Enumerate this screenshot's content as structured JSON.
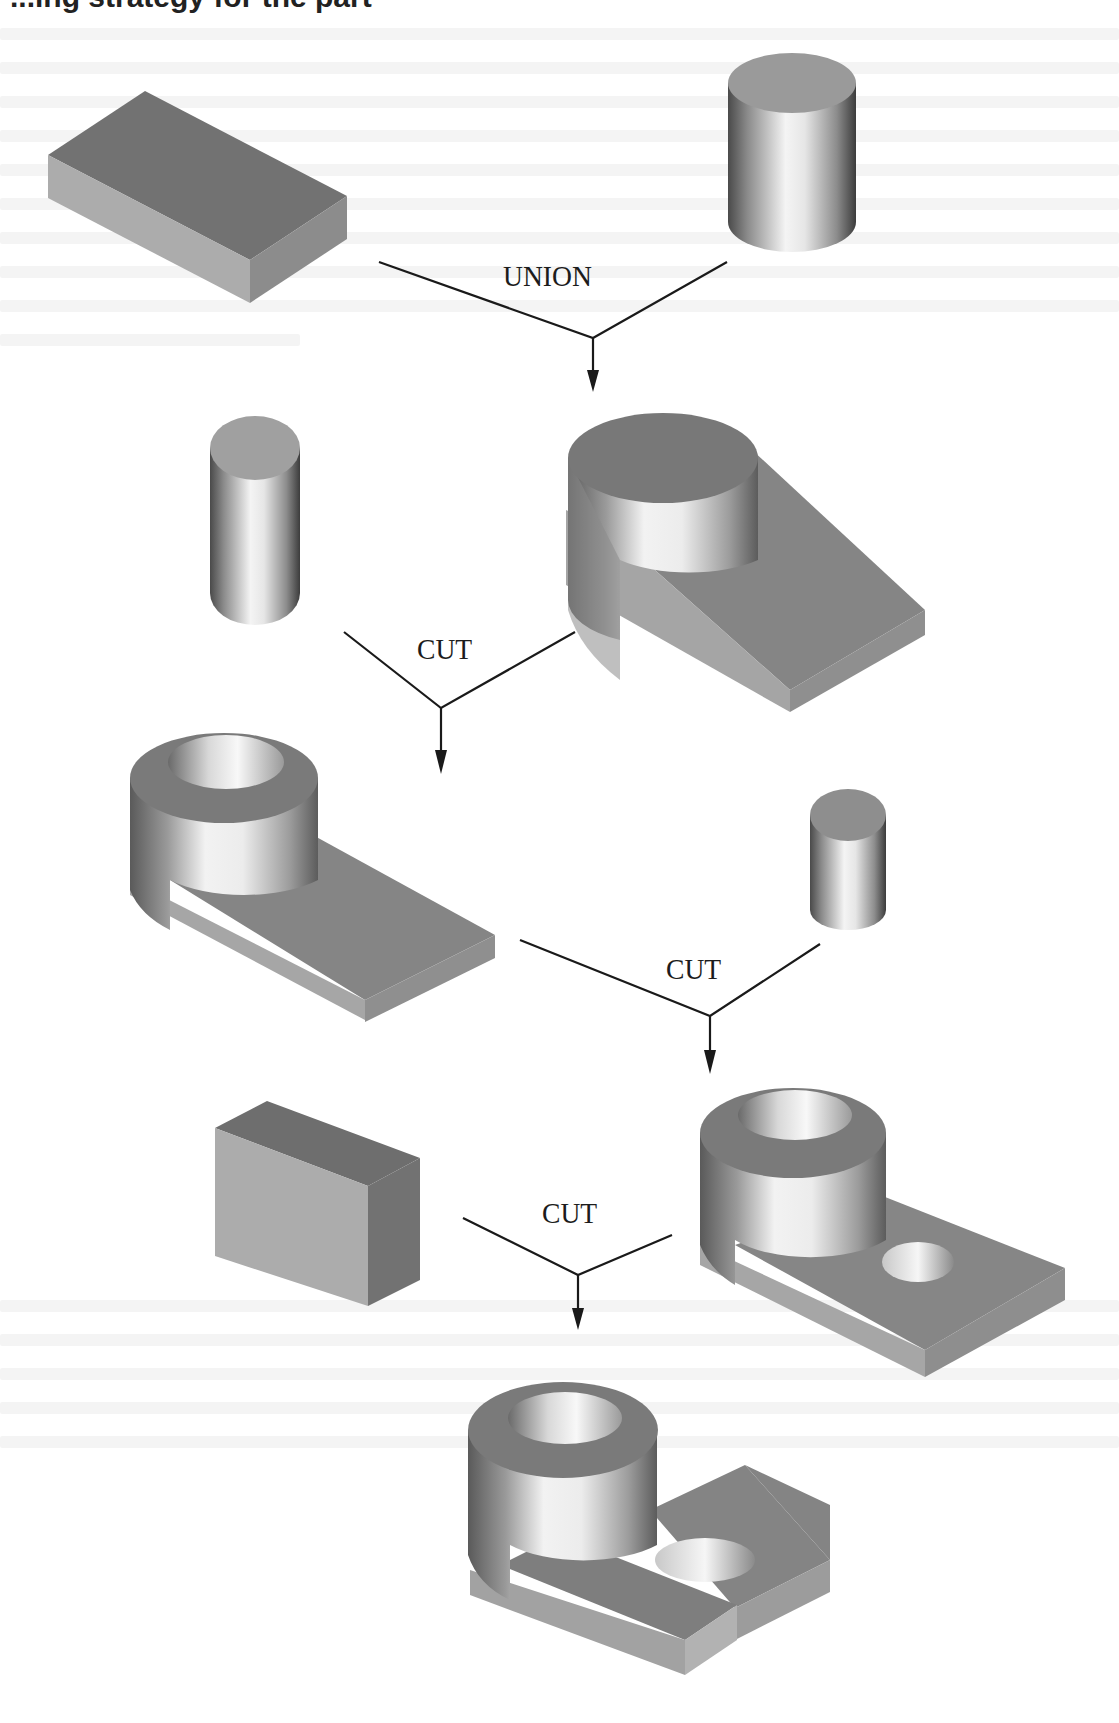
{
  "figure": {
    "heading_fragment": "...ing strategy for the part",
    "type": "CSG construction tree",
    "background": "#ffffff",
    "colors": {
      "dark_face": "#6f6f6f",
      "mid_face": "#8e8e8e",
      "light_face": "#b0b0b0",
      "highlight": "#f2f2f2",
      "line": "#1a1a1a"
    }
  },
  "operations": [
    {
      "id": "op1",
      "label": "UNION",
      "inputs": [
        "rectangular block",
        "tall cylinder"
      ],
      "result": "block with cylinder boss"
    },
    {
      "id": "op2",
      "label": "CUT",
      "inputs": [
        "block with cylinder boss",
        "cylinder (bore tool)"
      ],
      "result": "block with hollow boss"
    },
    {
      "id": "op3",
      "label": "CUT",
      "inputs": [
        "block with hollow boss",
        "small cylinder (hole tool)"
      ],
      "result": "block with hollow boss and through hole"
    },
    {
      "id": "op4",
      "label": "CUT",
      "inputs": [
        "rectangular slot block",
        "block with hollow boss and through hole"
      ],
      "result": "slotted bracket (final part)"
    }
  ],
  "solids": [
    {
      "name": "rectangular-block",
      "label": "block"
    },
    {
      "name": "tall-cylinder",
      "label": "cylinder"
    },
    {
      "name": "bore-cylinder",
      "label": "cylinder"
    },
    {
      "name": "boss-block",
      "label": "union result"
    },
    {
      "name": "hollow-boss-block",
      "label": "cut result 1"
    },
    {
      "name": "small-cylinder",
      "label": "small cylinder"
    },
    {
      "name": "slot-block",
      "label": "slot block"
    },
    {
      "name": "holed-boss-block",
      "label": "cut result 2"
    },
    {
      "name": "final-bracket",
      "label": "final part"
    }
  ]
}
